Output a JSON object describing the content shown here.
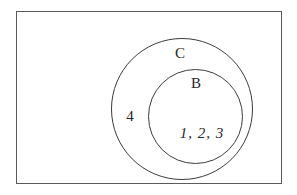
{
  "diagram": {
    "type": "euler-set-diagram",
    "background_color": "#ffffff",
    "line_color": "#3c3c3c",
    "rectangle_border_color": "#5a5a5a",
    "text_color": "#262626",
    "labels": {
      "outer_circle": "C",
      "inner_circle": "B",
      "region_between_circles": "4",
      "inner_circle_elements": "1, 2, 3"
    },
    "structure": {
      "universal_set": "rectangle",
      "set_c_contains": "set B and element 4",
      "set_b_contains": "elements 1, 2, 3"
    }
  }
}
